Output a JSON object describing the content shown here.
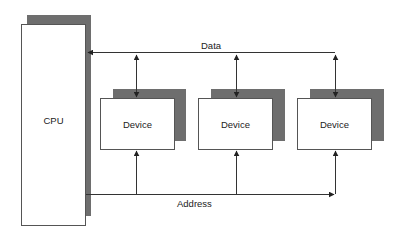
{
  "diagram": {
    "cpu": {
      "label": "CPU"
    },
    "devices": [
      {
        "label": "Device"
      },
      {
        "label": "Device"
      },
      {
        "label": "Device"
      }
    ],
    "buses": {
      "data": {
        "label": "Data",
        "direction": "bidirectional"
      },
      "address": {
        "label": "Address",
        "direction": "cpu-to-devices"
      }
    },
    "colors": {
      "shadow": "#6e6e6e",
      "line": "#333333",
      "box_border": "#555555"
    }
  }
}
